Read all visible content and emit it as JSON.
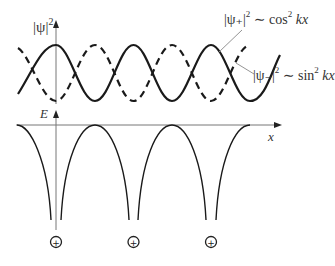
{
  "diagram": {
    "top_panel": {
      "y_axis_label": "|ψ|",
      "y_axis_sup": "2",
      "curve_plus": {
        "label": "|ψ₊|",
        "sup": "2",
        "relation": " ∼ cos",
        "rel_sup": "2",
        "arg": " kx",
        "style": "solid"
      },
      "curve_minus": {
        "label": "|ψ₋|",
        "sup": "2",
        "relation": " ∼ sin",
        "rel_sup": "2",
        "arg": " kx",
        "style": "dashed"
      }
    },
    "bottom_panel": {
      "y_axis_label": "E",
      "x_axis_label": "x"
    },
    "ions": [
      {
        "symbol": "+"
      },
      {
        "symbol": "+"
      },
      {
        "symbol": "+"
      }
    ],
    "colors": {
      "curve": "#1a1a1a",
      "axis": "#666666",
      "leader": "#888888"
    }
  }
}
